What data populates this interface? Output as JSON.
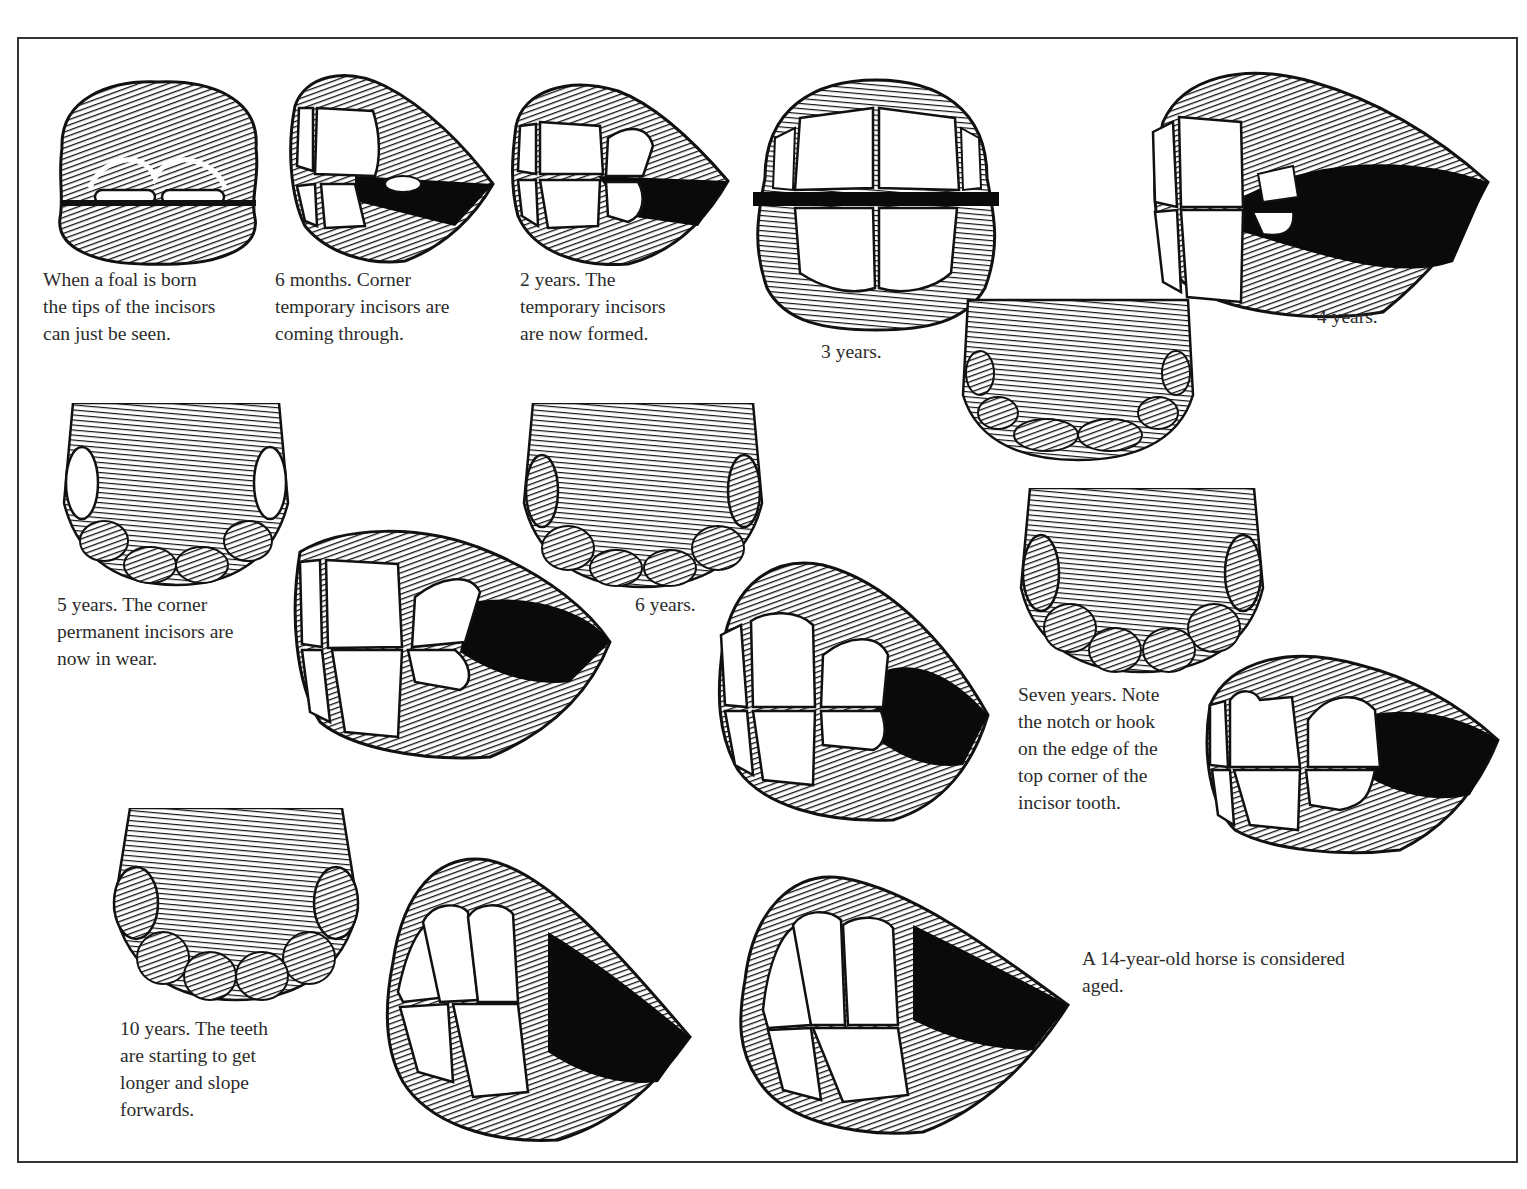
{
  "document": {
    "subject": "Ageing a horse by its teeth",
    "border_color": "#333333",
    "ink_color": "#111111"
  },
  "figures": [
    {
      "id": "foal",
      "view": "front",
      "caption": [
        "When a foal is born",
        "the tips of the incisors",
        "can just be seen."
      ]
    },
    {
      "id": "6-months",
      "view": "side",
      "caption": [
        "6 months.  Corner",
        "temporary incisors are",
        "coming through."
      ]
    },
    {
      "id": "2-years",
      "view": "side",
      "caption": [
        "2 years.  The",
        "temporary incisors",
        "are now formed."
      ]
    },
    {
      "id": "3-years",
      "view": "front",
      "caption": [
        "3 years."
      ]
    },
    {
      "id": "4-years",
      "view": "side+table",
      "caption": [
        "4 years."
      ]
    },
    {
      "id": "5-years",
      "view": "table+side",
      "caption": [
        "5 years. The corner",
        "permanent incisors are",
        "now in wear."
      ]
    },
    {
      "id": "6-years",
      "view": "table+side",
      "caption": [
        "6 years."
      ]
    },
    {
      "id": "7-years",
      "view": "table+side",
      "caption": [
        "Seven years. Note",
        "the notch or hook",
        "on the edge of the",
        "top corner of the",
        "incisor tooth."
      ]
    },
    {
      "id": "10-years",
      "view": "table+side",
      "caption": [
        "10 years.  The teeth",
        "are starting to get",
        "longer and slope",
        "forwards."
      ]
    },
    {
      "id": "14-years",
      "view": "side",
      "caption": [
        "A 14-year-old horse is considered",
        "aged."
      ]
    }
  ]
}
